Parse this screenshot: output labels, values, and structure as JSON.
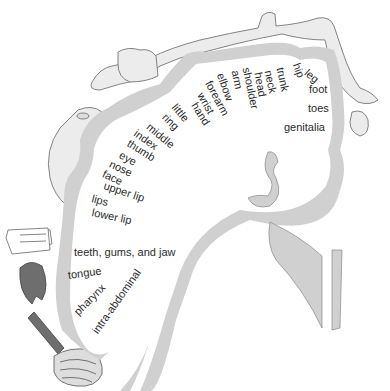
{
  "diagram": {
    "type": "sensory-homunculus",
    "colors": {
      "cortex": "#cfcfcf",
      "outline": "#555555",
      "text": "#2a2a2a",
      "body": "#ececec",
      "organ": "#6e6e6e"
    },
    "labels": [
      {
        "id": "genitalia",
        "text": "genitalia",
        "x": 284,
        "y": 122,
        "rot": 0
      },
      {
        "id": "toes",
        "text": "toes",
        "x": 308,
        "y": 103,
        "rot": 0
      },
      {
        "id": "foot",
        "text": "foot",
        "x": 309,
        "y": 84,
        "rot": 0
      },
      {
        "id": "leg",
        "text": "leg",
        "x": 306,
        "y": 66,
        "rot": 40
      },
      {
        "id": "hip",
        "text": "hip",
        "x": 296,
        "y": 58,
        "rot": 70
      },
      {
        "id": "trunk",
        "text": "trunk",
        "x": 280,
        "y": 62,
        "rot": 78
      },
      {
        "id": "neck",
        "text": "neck",
        "x": 268,
        "y": 65,
        "rot": 78
      },
      {
        "id": "head",
        "text": "head",
        "x": 258,
        "y": 67,
        "rot": 80
      },
      {
        "id": "shoulder",
        "text": "shoulder",
        "x": 246,
        "y": 62,
        "rot": 78
      },
      {
        "id": "arm",
        "text": "arm",
        "x": 235,
        "y": 65,
        "rot": 78
      },
      {
        "id": "elbow",
        "text": "elbow",
        "x": 220,
        "y": 68,
        "rot": 70
      },
      {
        "id": "forearm",
        "text": "forearm",
        "x": 208,
        "y": 76,
        "rot": 62
      },
      {
        "id": "wrist",
        "text": "wrist",
        "x": 200,
        "y": 88,
        "rot": 60
      },
      {
        "id": "hand",
        "text": "hand",
        "x": 194,
        "y": 98,
        "rot": 58
      },
      {
        "id": "little",
        "text": "little",
        "x": 174,
        "y": 100,
        "rot": 50
      },
      {
        "id": "ring",
        "text": "ring",
        "x": 164,
        "y": 110,
        "rot": 45
      },
      {
        "id": "middle",
        "text": "middle",
        "x": 148,
        "y": 120,
        "rot": 40
      },
      {
        "id": "index",
        "text": "index",
        "x": 135,
        "y": 127,
        "rot": 35
      },
      {
        "id": "thumb",
        "text": "thumb",
        "x": 128,
        "y": 137,
        "rot": 32
      },
      {
        "id": "eye",
        "text": "eye",
        "x": 120,
        "y": 149,
        "rot": 28
      },
      {
        "id": "nose",
        "text": "nose",
        "x": 110,
        "y": 158,
        "rot": 25
      },
      {
        "id": "face",
        "text": "face",
        "x": 103,
        "y": 168,
        "rot": 25
      },
      {
        "id": "upper_lip",
        "text": "upper lip",
        "x": 104,
        "y": 180,
        "rot": 18
      },
      {
        "id": "lips",
        "text": "lips",
        "x": 92,
        "y": 193,
        "rot": 15
      },
      {
        "id": "lower_lip",
        "text": "lower lip",
        "x": 92,
        "y": 207,
        "rot": 12
      },
      {
        "id": "teeth",
        "text": "teeth, gums, and jaw",
        "x": 74,
        "y": 247,
        "rot": 0
      },
      {
        "id": "tongue",
        "text": "tongue",
        "x": 68,
        "y": 270,
        "rot": -8
      },
      {
        "id": "pharynx",
        "text": "pharynx",
        "x": 76,
        "y": 308,
        "rot": -45
      },
      {
        "id": "intra_abdominal",
        "text": "intra-abdominal",
        "x": 95,
        "y": 327,
        "rot": -55
      }
    ]
  }
}
